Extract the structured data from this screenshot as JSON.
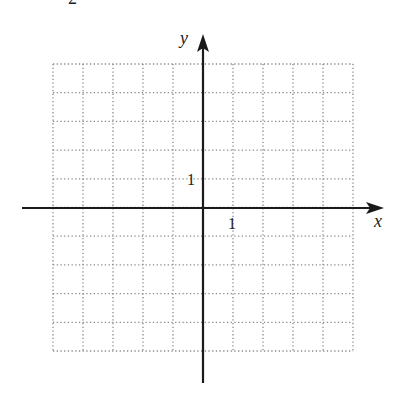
{
  "figure": {
    "label_partial": "2",
    "axes": {
      "x_label": "x",
      "y_label": "y"
    },
    "ticks": {
      "x_unit_label": "1",
      "y_unit_label": "1"
    },
    "grid": {
      "x_min": -5,
      "x_max": 5,
      "y_min": -5,
      "y_max": 5,
      "step": 1,
      "style": "dotted"
    },
    "colors": {
      "axis": "#1a1a1a",
      "grid": "#8a8a8a",
      "background": "#ffffff"
    }
  }
}
